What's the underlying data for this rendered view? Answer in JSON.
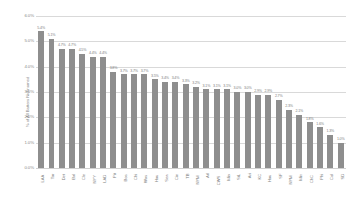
{
  "chart_data": {
    "type": "bar",
    "title": "",
    "xlabel": "",
    "ylabel": "% of All Batters Nicknamed",
    "ylim": [
      0,
      6
    ],
    "ytick_labels": [
      "6.0%",
      "5.0%",
      "4.0%",
      "3.0%",
      "2.0%",
      "1.0%",
      "0.0%"
    ],
    "ytick_values": [
      6,
      5,
      4,
      3,
      2,
      1,
      0
    ],
    "grid": true,
    "legend": "none",
    "bar_color": "#8e8e8e",
    "categories": [
      "LAA",
      "Tor",
      "Det",
      "Bal",
      "Cle",
      "NYY",
      "LAD",
      "Pit",
      "Bos",
      "Chi",
      "Was",
      "Hou",
      "Sea",
      "Cin",
      "TB",
      "NYM",
      "Atl",
      "CWS",
      "Mia",
      "StL",
      "Ari",
      "KC",
      "Hou",
      "SF",
      "NYM",
      "Min",
      "ChC",
      "Phi",
      "Col",
      "SD"
    ],
    "values": [
      5.4,
      5.1,
      4.7,
      4.7,
      4.5,
      4.4,
      4.4,
      3.8,
      3.7,
      3.7,
      3.7,
      3.5,
      3.4,
      3.4,
      3.3,
      3.2,
      3.1,
      3.1,
      3.1,
      3.0,
      3.0,
      2.9,
      2.9,
      2.7,
      2.3,
      2.1,
      1.8,
      1.6,
      1.3,
      1.0
    ],
    "data_labels": [
      "5.4%",
      "5.1%",
      "4.7%",
      "4.7%",
      "4.5%",
      "4.4%",
      "4.4%",
      "3.8%",
      "3.7%",
      "3.7%",
      "3.7%",
      "3.5%",
      "3.4%",
      "3.4%",
      "3.3%",
      "3.2%",
      "3.1%",
      "3.1%",
      "3.1%",
      "3.0%",
      "3.0%",
      "2.9%",
      "2.9%",
      "2.7%",
      "2.3%",
      "2.1%",
      "1.8%",
      "1.6%",
      "1.3%",
      "1.0%"
    ]
  }
}
